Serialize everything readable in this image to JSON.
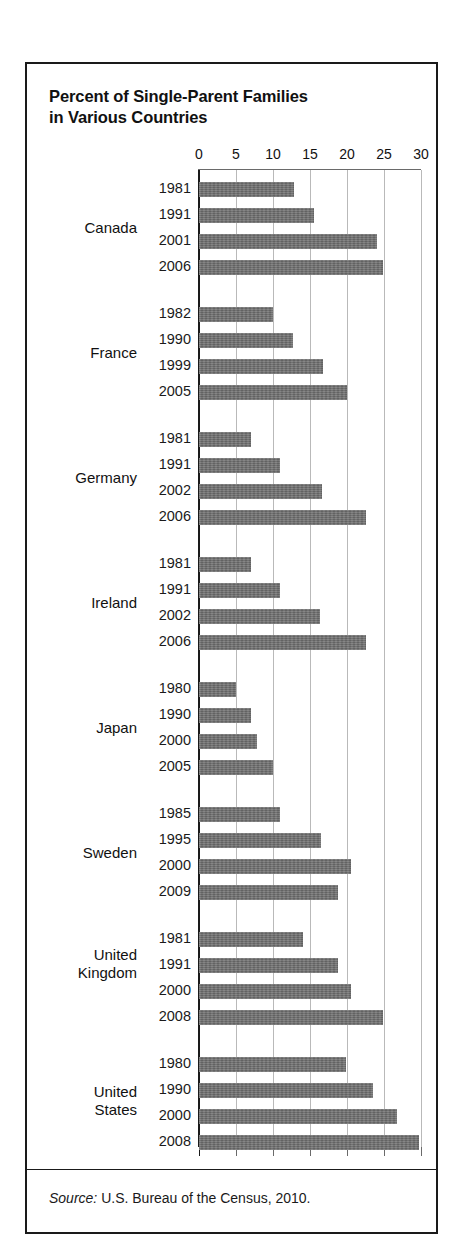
{
  "title": "Percent of Single-Parent Families in Various Countries",
  "title_line1": "Percent of Single-Parent Families",
  "title_line2": "in Various Countries",
  "source": {
    "label": "Source:",
    "text": "U.S. Bureau of the Census, 2010."
  },
  "chart_data": {
    "type": "bar",
    "orientation": "horizontal",
    "title": "Percent of Single-Parent Families in Various Countries",
    "xlabel": "",
    "ylabel": "",
    "xlim": [
      0,
      30
    ],
    "xticks": [
      0,
      5,
      10,
      15,
      20,
      25,
      30
    ],
    "xtick_labels": [
      "0",
      "5",
      "10",
      "15",
      "20",
      "25",
      "30"
    ],
    "grid": true,
    "grid_axis": "x",
    "legend": false,
    "bar_color": "#6e6e6e",
    "groups": [
      {
        "country": "Canada",
        "country_label_lines": [
          "Canada"
        ],
        "bars": [
          {
            "year": "1981",
            "value": 12.8
          },
          {
            "year": "1991",
            "value": 15.5
          },
          {
            "year": "2001",
            "value": 24.0
          },
          {
            "year": "2006",
            "value": 24.8
          }
        ]
      },
      {
        "country": "France",
        "country_label_lines": [
          "France"
        ],
        "bars": [
          {
            "year": "1982",
            "value": 10.0
          },
          {
            "year": "1990",
            "value": 12.7
          },
          {
            "year": "1999",
            "value": 16.8
          },
          {
            "year": "2005",
            "value": 20.0
          }
        ]
      },
      {
        "country": "Germany",
        "country_label_lines": [
          "Germany"
        ],
        "bars": [
          {
            "year": "1981",
            "value": 7.0
          },
          {
            "year": "1991",
            "value": 11.0
          },
          {
            "year": "2002",
            "value": 16.6
          },
          {
            "year": "2006",
            "value": 22.5
          }
        ]
      },
      {
        "country": "Ireland",
        "country_label_lines": [
          "Ireland"
        ],
        "bars": [
          {
            "year": "1981",
            "value": 7.0
          },
          {
            "year": "1991",
            "value": 11.0
          },
          {
            "year": "2002",
            "value": 16.3
          },
          {
            "year": "2006",
            "value": 22.5
          }
        ]
      },
      {
        "country": "Japan",
        "country_label_lines": [
          "Japan"
        ],
        "bars": [
          {
            "year": "1980",
            "value": 5.0
          },
          {
            "year": "1990",
            "value": 7.0
          },
          {
            "year": "2000",
            "value": 7.8
          },
          {
            "year": "2005",
            "value": 10.0
          }
        ]
      },
      {
        "country": "Sweden",
        "country_label_lines": [
          "Sweden"
        ],
        "bars": [
          {
            "year": "1985",
            "value": 11.0
          },
          {
            "year": "1995",
            "value": 16.5
          },
          {
            "year": "2000",
            "value": 20.5
          },
          {
            "year": "2009",
            "value": 18.8
          }
        ]
      },
      {
        "country": "United Kingdom",
        "country_label_lines": [
          "United",
          "Kingdom"
        ],
        "bars": [
          {
            "year": "1981",
            "value": 14.0
          },
          {
            "year": "1991",
            "value": 18.8
          },
          {
            "year": "2000",
            "value": 20.6
          },
          {
            "year": "2008",
            "value": 24.8
          }
        ]
      },
      {
        "country": "United States",
        "country_label_lines": [
          "United",
          "States"
        ],
        "bars": [
          {
            "year": "1980",
            "value": 19.8
          },
          {
            "year": "1990",
            "value": 23.5
          },
          {
            "year": "2000",
            "value": 26.8
          },
          {
            "year": "2008",
            "value": 29.7
          }
        ]
      }
    ]
  }
}
